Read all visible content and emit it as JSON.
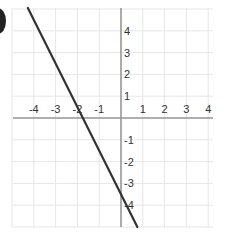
{
  "problem": {
    "marker_label": ")"
  },
  "chart_data": {
    "type": "line",
    "title": "",
    "xlabel": "",
    "ylabel": "",
    "xlim": [
      -5,
      4.5
    ],
    "ylim": [
      -5,
      5
    ],
    "grid": true,
    "x_ticks": [
      -4,
      -3,
      -2,
      -1,
      1,
      2,
      3,
      4
    ],
    "y_ticks": [
      4,
      3,
      2,
      1,
      -1,
      -2,
      -3,
      -4
    ],
    "x_tick_labels": [
      "-4",
      "-3",
      "-2",
      "-1",
      "1",
      "2",
      "3",
      "4"
    ],
    "y_tick_labels": [
      "4",
      "3",
      "2",
      "1",
      "-1",
      "-2",
      "-3",
      "-4"
    ],
    "series": [
      {
        "name": "line",
        "color": "#333333",
        "points": [
          [
            -4,
            5
          ],
          [
            1,
            -5
          ]
        ],
        "equation": "y = -2x - 3.5",
        "x_intercept": -1.75,
        "y_intercept": -3.5
      }
    ],
    "colors": {
      "grid": "#e6e6e6",
      "axis": "#999999",
      "line": "#333333",
      "text": "#333333"
    }
  }
}
